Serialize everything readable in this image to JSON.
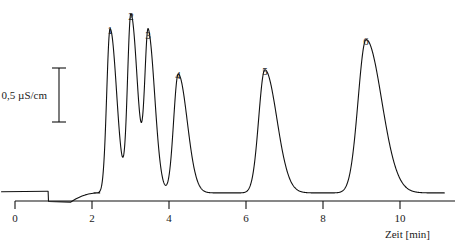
{
  "figure": {
    "kind": "chromatogram",
    "background_color": "#ffffff",
    "trace_color": "#111111"
  },
  "chart_data": {
    "type": "line",
    "title": "",
    "xlabel": "Zeit [min]",
    "ylabel": "",
    "xlim": [
      -0.4,
      11.2
    ],
    "ylim": [
      0,
      1.85
    ],
    "grid": false,
    "legend": false,
    "x_ticks": [
      0,
      2,
      4,
      6,
      8,
      10
    ],
    "x_tick_labels": [
      "0",
      "2",
      "4",
      "6",
      "8",
      "10"
    ],
    "y_axis_visible": false,
    "scale_bar": {
      "label": "0,5 µS/cm",
      "value": 0.5,
      "unit": "µS/cm",
      "x_position_min": 1.15,
      "y_low": 0.77,
      "y_high": 1.27
    },
    "injection_spike": {
      "label": "",
      "retention_time": 0.86,
      "height": 0.09
    },
    "peaks": [
      {
        "label": "1",
        "retention_time": 2.47,
        "height": 1.52,
        "width": 0.11
      },
      {
        "label": "2",
        "retention_time": 3.01,
        "height": 1.65,
        "width": 0.11
      },
      {
        "label": "3",
        "retention_time": 3.46,
        "height": 1.47,
        "width": 0.11
      },
      {
        "label": "4",
        "retention_time": 4.24,
        "height": 1.1,
        "width": 0.15
      },
      {
        "label": "5",
        "retention_time": 6.49,
        "height": 1.14,
        "width": 0.2
      },
      {
        "label": "6",
        "retention_time": 9.12,
        "height": 1.42,
        "width": 0.26
      }
    ],
    "series": [
      {
        "name": "conductivity",
        "x": [
          2.47,
          3.01,
          3.46,
          4.24,
          6.49,
          9.12
        ],
        "values": [
          1.52,
          1.65,
          1.47,
          1.1,
          1.14,
          1.42
        ]
      }
    ]
  },
  "axis": {
    "x_title": "Zeit [min]",
    "tick_labels": [
      "0",
      "2",
      "4",
      "6",
      "8",
      "10"
    ]
  },
  "scale": {
    "label": "0,5 µS/cm"
  },
  "peak_labels": {
    "p1": "1",
    "p2": "2",
    "p3": "3",
    "p4": "4",
    "p5": "5",
    "p6": "6"
  }
}
